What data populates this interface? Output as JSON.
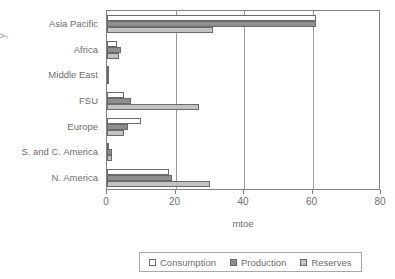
{
  "axis_title_fragment": "y",
  "chart_data": {
    "type": "bar",
    "orientation": "horizontal",
    "title": "",
    "xlabel": "mtoe",
    "ylabel": "",
    "xlim": [
      0,
      80
    ],
    "xticks": [
      0,
      20,
      40,
      60,
      80
    ],
    "xtick_labels": [
      "0",
      "20",
      "40",
      "60",
      "80"
    ],
    "grid": true,
    "grid_axis": "x",
    "legend_position": "bottom",
    "categories": [
      "Asia Pacific",
      "Africa",
      "Middle East",
      "FSU",
      "Europe",
      "S. and C. America",
      "N. America"
    ],
    "series": [
      {
        "name": "Consumption",
        "color": "#ffffff",
        "values": [
          61,
          3,
          0.3,
          5,
          10,
          0.3,
          18
        ]
      },
      {
        "name": "Production",
        "color": "#8f8f8f",
        "values": [
          61,
          4,
          0.3,
          7,
          6,
          1.5,
          19
        ]
      },
      {
        "name": "Reserves",
        "color": "#c3c3c3",
        "values": [
          31,
          3.5,
          0.3,
          27,
          5,
          1.5,
          30
        ]
      }
    ]
  }
}
